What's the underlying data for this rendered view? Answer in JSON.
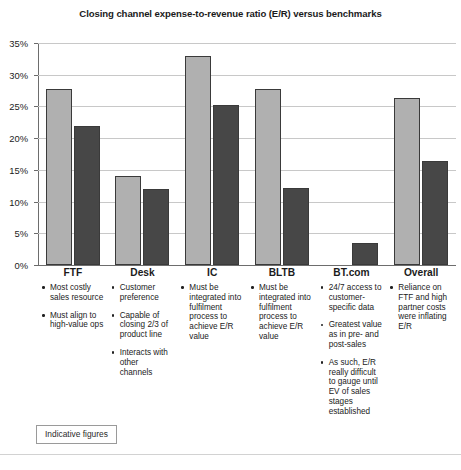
{
  "chart_data": {
    "type": "bar",
    "title": "Closing channel expense-to-revenue ratio (E/R) versus benchmarks",
    "xlabel": "",
    "ylabel": "",
    "ylim": [
      0,
      35
    ],
    "ytick_labels": [
      "0%",
      "5%",
      "10%",
      "15%",
      "20%",
      "25%",
      "30%",
      "35%"
    ],
    "ytick_values": [
      0,
      5,
      10,
      15,
      20,
      25,
      30,
      35
    ],
    "grid": true,
    "legend": "none",
    "categories": [
      "FTF",
      "Desk",
      "IC",
      "BLTB",
      "BT.com",
      "Overall"
    ],
    "series": [
      {
        "name": "Closing channel E/R",
        "color": "#b0b0b0",
        "values": [
          27.7,
          14.1,
          32.9,
          27.8,
          null,
          26.4
        ]
      },
      {
        "name": "Benchmark E/R",
        "color": "#474747",
        "values": [
          21.9,
          12.0,
          25.3,
          12.2,
          3.4,
          16.4
        ]
      }
    ]
  },
  "notes": {
    "columns": [
      {
        "category": "FTF",
        "items": [
          "Most costly sales resource",
          "Must align to high-value ops"
        ]
      },
      {
        "category": "Desk",
        "items": [
          "Customer preference",
          "Capable of closing 2/3 of product line",
          "Interacts with other channels"
        ]
      },
      {
        "category": "IC",
        "items": [
          "Must be integrated into fulfilment process to achieve E/R value"
        ]
      },
      {
        "category": "BLTB",
        "items": [
          "Must be integrated into fulfilment process to achieve E/R value"
        ]
      },
      {
        "category": "BT.com",
        "items": [
          "24/7 access to customer-specific data",
          "Greatest value as in pre- and post-sales",
          "As such, E/R really difficult to gauge until EV of sales stages established"
        ]
      },
      {
        "category": "Overall",
        "items": [
          "Reliance on FTF and high partner costs were inflating E/R"
        ]
      }
    ]
  },
  "footnote": {
    "label": "Indicative figures"
  }
}
